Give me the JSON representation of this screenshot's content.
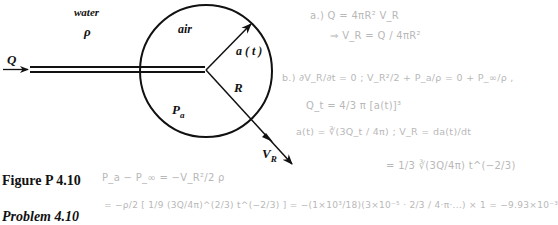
{
  "figure": {
    "labels": {
      "water": "water",
      "rho": "ρ",
      "air": "air",
      "a_t": "a ( t )",
      "R": "R",
      "P_a_main": "P",
      "P_a_sub": "a",
      "Q": "Q",
      "V_R_main": "V",
      "V_R_sub": "R"
    },
    "caption": "Figure P 4.10",
    "problem_label": "Problem 4.10"
  },
  "handwritten": {
    "line1": "a.)  Q = 4πR² V_R",
    "line2": "⇒  V_R  =  Q / 4πR²",
    "line3": "b.)  ∂V_R/∂t = 0  ;   V_R²/2 + P_a/ρ = 0 + P_∞/ρ ,",
    "line4": "Q_t  =  4/3 π [a(t)]³",
    "line5": "a(t) = ∛(3Q_t / 4π)  ;  V_R = da(t)/dt",
    "line6": "= 1/3 ∛(3Q/4π) t^(−2/3)",
    "line7": "P_a − P_∞ = −V_R²/2 ρ",
    "line8": "= −ρ/2 [ 1/9 (3Q/4π)^(2/3) t^(−2/3) ]  =  −(1×10³/18)(3×10⁻⁵ · 2/3 / 4·π·...) × 1 = −9.93×10⁻³"
  },
  "colors": {
    "ink": "#111111",
    "pencil": "#b8b8b8"
  }
}
